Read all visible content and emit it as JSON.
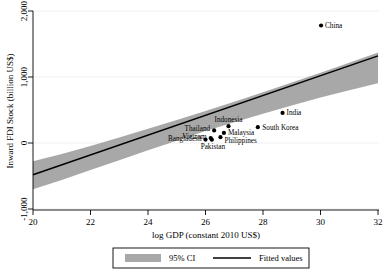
{
  "chart_data": {
    "type": "scatter",
    "title": "",
    "xlabel": "log GDP (constant 2010 US$)",
    "ylabel": "Inward FDI Stock (billion US$)",
    "xlim": [
      20,
      32
    ],
    "ylim": [
      -1000,
      2000
    ],
    "xticks": [
      20,
      22,
      24,
      26,
      28,
      30,
      32
    ],
    "xtick_labels": [
      "20",
      "22",
      "24",
      "26",
      "28",
      "30",
      "32"
    ],
    "yticks": [
      -1000,
      0,
      1000,
      2000
    ],
    "ytick_labels": [
      "-1,000",
      "0",
      "1,000",
      "2,000"
    ],
    "grid": "horizontal-faint",
    "legend_position": "below-outside",
    "legend": [
      {
        "label": "95% CI",
        "marker": "band-swatch",
        "color": "#a8a8a8"
      },
      {
        "label": "Fitted values",
        "marker": "line",
        "color": "#000000"
      }
    ],
    "points": [
      {
        "label": "China",
        "x": 30.02,
        "y": 1780,
        "label_dx": 4,
        "label_dy": 2.5,
        "anchor": "start"
      },
      {
        "label": "India",
        "x": 28.68,
        "y": 455,
        "label_dx": 4,
        "label_dy": 2.5,
        "anchor": "start"
      },
      {
        "label": "South Korea",
        "x": 27.82,
        "y": 240,
        "label_dx": 4.5,
        "label_dy": 2.5,
        "anchor": "start"
      },
      {
        "label": "Indonesia",
        "x": 26.8,
        "y": 255,
        "label_dx": 0,
        "label_dy": -4,
        "anchor": "middle"
      },
      {
        "label": "Thailand",
        "x": 26.3,
        "y": 190,
        "label_dx": -4,
        "label_dy": 0.5,
        "anchor": "end"
      },
      {
        "label": "Malaysia",
        "x": 26.64,
        "y": 152,
        "label_dx": 4,
        "label_dy": 2.5,
        "anchor": "start"
      },
      {
        "label": "Philippines",
        "x": 26.52,
        "y": 88,
        "label_dx": 4,
        "label_dy": 5.5,
        "anchor": "start"
      },
      {
        "label": "Vietnam",
        "x": 26.18,
        "y": 75,
        "label_dx": -4,
        "label_dy": 0.5,
        "anchor": "end"
      },
      {
        "label": "Bangladesh",
        "x": 26.0,
        "y": 52,
        "label_dx": -4,
        "label_dy": 1.5,
        "anchor": "end"
      },
      {
        "label": "Pakistan",
        "x": 26.22,
        "y": 50,
        "label_dx": 1,
        "label_dy": 9,
        "anchor": "middle"
      }
    ],
    "fitted_line": {
      "x": [
        20,
        32
      ],
      "y": [
        -480,
        1320
      ]
    },
    "ci_band": {
      "x": [
        20,
        21,
        22,
        23,
        24,
        25,
        26,
        27,
        28,
        29,
        30,
        31,
        32
      ],
      "lower": [
        -700,
        -560,
        -410,
        -260,
        -110,
        35,
        180,
        315,
        445,
        570,
        690,
        800,
        905
      ],
      "upper": [
        -275,
        -165,
        -45,
        85,
        215,
        350,
        485,
        625,
        770,
        915,
        1065,
        1215,
        1370
      ]
    },
    "colors": {
      "ci_fill": "#a8a8a8",
      "fit_line": "#000000",
      "marker": "#000000",
      "grid": "#e8e8ec",
      "axis": "#000000",
      "background": "#ffffff"
    }
  }
}
